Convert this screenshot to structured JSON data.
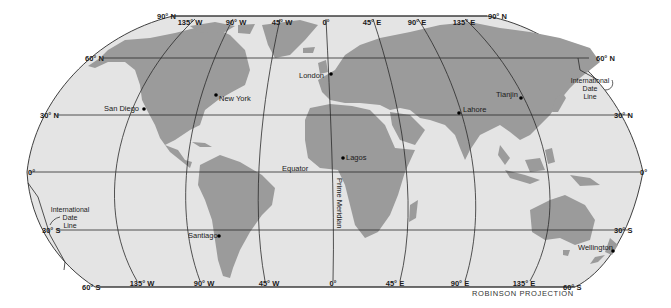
{
  "map": {
    "projection_label": "ROBINSON PROJECTION",
    "colors": {
      "ocean": "#e4e4e4",
      "land": "#9b9b9b",
      "grid": "#2a2a2a",
      "city_dot": "#000000",
      "background": "#ffffff"
    },
    "parallels": [
      {
        "label": "90° N",
        "label_right": "90° N"
      },
      {
        "label": "60° N",
        "label_right": "60° N"
      },
      {
        "label": "30° N",
        "label_right": "30° N"
      },
      {
        "label": "0°",
        "label_right": "0°"
      },
      {
        "label": "30° S",
        "label_right": "30° S"
      },
      {
        "label": "60° S",
        "label_right": "60° S"
      }
    ],
    "meridians_top": [
      "135° W",
      "90° W",
      "45° W",
      "0°",
      "45° E",
      "90° E",
      "135° E"
    ],
    "meridians_bottom": [
      "135° W",
      "90° W",
      "45° W",
      "0°",
      "45° E",
      "90° E",
      "135° E"
    ],
    "special_lines": {
      "equator": "Equator",
      "prime_meridian": "Prime Meridian",
      "date_line_east": [
        "International",
        "Date",
        "Line"
      ],
      "date_line_west": [
        "International",
        "Date",
        "Line"
      ]
    },
    "cities": [
      {
        "name": "London"
      },
      {
        "name": "New York"
      },
      {
        "name": "San Diego"
      },
      {
        "name": "Lahore"
      },
      {
        "name": "Tianjin"
      },
      {
        "name": "Lagos"
      },
      {
        "name": "Santiago"
      },
      {
        "name": "Wellington"
      }
    ]
  }
}
